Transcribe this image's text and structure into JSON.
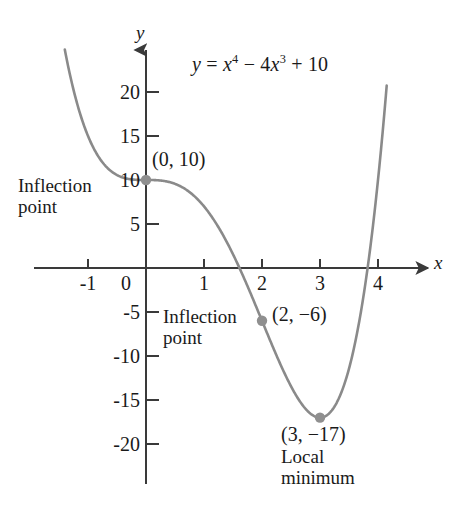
{
  "figure": {
    "name": "quartic-graph",
    "background": "#ffffff",
    "curve_color": "#8a8a8a",
    "axis_color": "#3a3a3a",
    "point_color": "#8f8f8f"
  },
  "axes": {
    "x_label": "x",
    "y_label": "y",
    "x_ticks": [
      "-1",
      "0",
      "1",
      "2",
      "3",
      "4"
    ],
    "y_ticks": [
      "20",
      "15",
      "10",
      "5",
      "-5",
      "-10",
      "-15",
      "-20"
    ]
  },
  "equation": {
    "lhs": "y",
    "eq": "=",
    "term1_base": "x",
    "term1_exp": "4",
    "minus": "−",
    "term2_coef": "4",
    "term2_base": "x",
    "term2_exp": "3",
    "plus": "+",
    "term3": "10",
    "plain": "y = x⁴ − 4x³ + 10"
  },
  "annotations": {
    "inflection_left": {
      "line1": "Inflection",
      "line2": "point"
    },
    "inflection_mid": {
      "line1": "Inflection",
      "line2": "point"
    },
    "local_min": {
      "line1": "Local",
      "line2": "minimum"
    },
    "coord_origin": "(0, 10)",
    "coord_inflection": "(2, −6)",
    "coord_minimum": "(3, −17)"
  },
  "chart_data": {
    "type": "line",
    "title": "",
    "subtitle": "",
    "xlabel": "x",
    "ylabel": "y",
    "function": "y = x^4 - 4x^3 + 10",
    "xlim": [
      -1.45,
      4.45
    ],
    "ylim": [
      -23.5,
      25.5
    ],
    "grid": false,
    "legend": null,
    "x_ticks": [
      -1,
      0,
      1,
      2,
      3,
      4
    ],
    "y_ticks": [
      20,
      15,
      10,
      5,
      -5,
      -10,
      -15,
      -20
    ],
    "series": [
      {
        "name": "y = x^4 - 4x^3 + 10",
        "color": "#8a8a8a",
        "x": [
          -1.4,
          -1.3,
          -1.2,
          -1.1,
          -1.0,
          -0.9,
          -0.8,
          -0.7,
          -0.6,
          -0.5,
          -0.4,
          -0.3,
          -0.2,
          -0.1,
          0.0,
          0.2,
          0.4,
          0.6,
          0.8,
          1.0,
          1.2,
          1.4,
          1.6,
          1.8,
          2.0,
          2.2,
          2.4,
          2.6,
          2.8,
          3.0,
          3.2,
          3.4,
          3.6,
          3.8,
          4.0,
          4.15
        ],
        "y": [
          24.8,
          21.6,
          18.9,
          16.8,
          15.0,
          13.5,
          12.5,
          11.6,
          11.0,
          10.6,
          10.3,
          10.1,
          10.0,
          10.0,
          10.0,
          9.97,
          9.74,
          9.27,
          8.45,
          7.0,
          4.99,
          2.13,
          -1.82,
          -7.08,
          -6.0,
          -10.22,
          -13.89,
          -16.15,
          -17.12,
          -17.0,
          -15.69,
          -12.54,
          -6.88,
          2.01,
          10.0,
          18.02
        ]
      }
    ],
    "points": [
      {
        "label": "(0, 10)",
        "x": 0,
        "y": 10,
        "kind": "inflection-point"
      },
      {
        "label": "(2, −6)",
        "x": 2,
        "y": -6,
        "kind": "inflection-point"
      },
      {
        "label": "(3, −17)",
        "x": 3,
        "y": -17,
        "kind": "local-minimum"
      }
    ]
  }
}
